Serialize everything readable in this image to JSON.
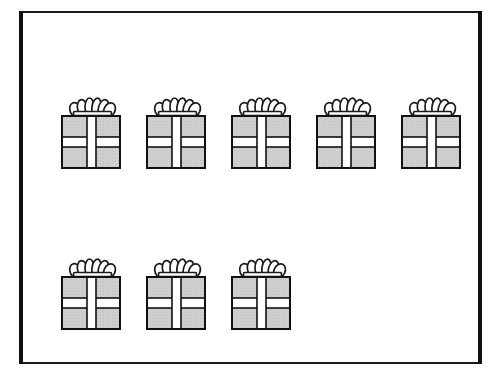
{
  "figure": {
    "total_objects": 8,
    "object_name": "gift-box",
    "background_color": "#ffffff"
  },
  "frame": {
    "name": "outer-rectangle-frame",
    "stroke_color": "#111111",
    "left_x": 19,
    "right_x": 478,
    "top_y": 11,
    "bottom_y": 362,
    "vertical_thickness": 4,
    "horizontal_thickness": 2
  },
  "box_style": {
    "fill_color": "#d2d2d2",
    "stipple_color": "#bdbdbd",
    "ribbon_color": "#ffffff",
    "outline_color": "#111111",
    "bow_color": "#1a1a1a",
    "body_width": 58,
    "body_height": 52,
    "bow_height": 18
  },
  "rows": [
    {
      "name": "row-1",
      "label": "top row",
      "count": 5,
      "y": 116,
      "boxes": [
        {
          "index": 1,
          "x": 61
        },
        {
          "index": 2,
          "x": 146
        },
        {
          "index": 3,
          "x": 231
        },
        {
          "index": 4,
          "x": 316
        },
        {
          "index": 5,
          "x": 401
        }
      ]
    },
    {
      "name": "row-2",
      "label": "bottom row",
      "count": 3,
      "y": 277,
      "boxes": [
        {
          "index": 6,
          "x": 61
        },
        {
          "index": 7,
          "x": 146
        },
        {
          "index": 8,
          "x": 231
        }
      ]
    }
  ]
}
